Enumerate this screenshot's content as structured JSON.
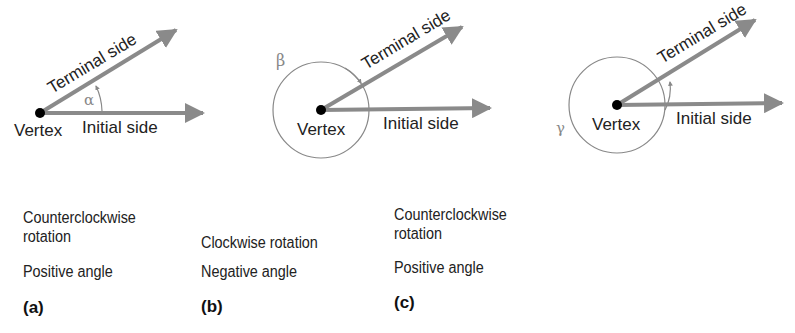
{
  "panels": [
    {
      "id": "a",
      "angle_symbol": "α",
      "vertex_label": "Vertex",
      "terminal_label": "Terminal side",
      "initial_label": "Initial side",
      "caption_line1": "Counterclockwise",
      "caption_line2": "rotation",
      "caption_sign": "Positive angle",
      "panel_label": "(a)"
    },
    {
      "id": "b",
      "angle_symbol": "β",
      "vertex_label": "Vertex",
      "terminal_label": "Terminal side",
      "initial_label": "Initial side",
      "caption_line1": "Clockwise rotation",
      "caption_sign": "Negative angle",
      "panel_label": "(b)"
    },
    {
      "id": "c",
      "angle_symbol": "γ",
      "vertex_label": "Vertex",
      "terminal_label": "Terminal side",
      "initial_label": "Initial side",
      "caption_line1": "Counterclockwise",
      "caption_line2": "rotation",
      "caption_sign": "Positive angle",
      "panel_label": "(c)"
    }
  ],
  "colors": {
    "ray": "#8a8a8a",
    "text": "#222222",
    "arc": "#888888",
    "vertex": "#000000"
  }
}
